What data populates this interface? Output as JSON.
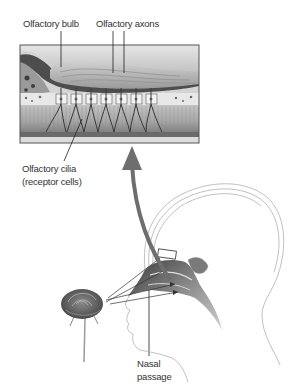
{
  "diagram": {
    "type": "anatomical-illustration",
    "labels": {
      "olfactory_bulb": "Olfactory bulb",
      "olfactory_axons": "Olfactory axons",
      "olfactory_cilia_line1": "Olfactory cilia",
      "olfactory_cilia_line2": "(receptor cells)",
      "nasal_passage_line1": "Nasal",
      "nasal_passage_line2": "passage"
    },
    "colors": {
      "arrow": "#6e6e6e",
      "inset_border": "#555555",
      "tissue_dark": "#4a4a4a",
      "tissue_light": "#bdbdbd",
      "outline": "#999999"
    }
  }
}
